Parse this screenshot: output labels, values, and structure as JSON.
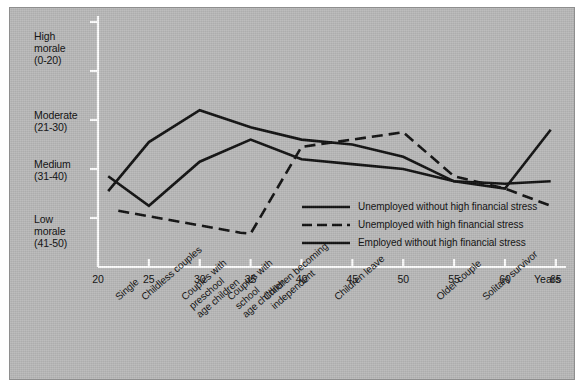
{
  "chart_data": {
    "type": "line",
    "title": "",
    "xlabel": "Years",
    "ylabel": "",
    "xlim": [
      20,
      66
    ],
    "ylim": [
      0,
      50
    ],
    "grid": false,
    "legend_position": "inside-bottom-right",
    "y_axis_bands": [
      {
        "label": "High\nmorale\n(0-20)",
        "range": "0-20"
      },
      {
        "label": "Moderate\n(21-30)",
        "range": "21-30"
      },
      {
        "label": "Medium\n(31-40)",
        "range": "31-40"
      },
      {
        "label": "Low\nmorale\n(41-50)",
        "range": "41-50"
      }
    ],
    "x_tick_labels": [
      "20",
      "25",
      "30",
      "35",
      "40",
      "45",
      "50",
      "55",
      "60",
      "65"
    ],
    "x_tick_values": [
      20,
      25,
      30,
      35,
      40,
      45,
      50,
      55,
      60,
      65
    ],
    "x_axis_unit_label": "Years",
    "life_stage_labels": [
      {
        "text": "Single",
        "at": 21.5
      },
      {
        "text": "Childless couples",
        "at": 24.0
      },
      {
        "text": "Couples with\npreschool\nage children",
        "at": 28.0
      },
      {
        "text": "Couples with\nschool\nage children",
        "at": 32.5
      },
      {
        "text": "Children becoming\nindependent",
        "at": 36.0
      },
      {
        "text": "Children leave",
        "at": 43.0
      },
      {
        "text": "Older couple",
        "at": 53.0
      },
      {
        "text": "Solitary survivor",
        "at": 57.5
      }
    ],
    "series": [
      {
        "name": "Unemployed without high financial stress",
        "style": "solid",
        "color": "#111111",
        "points": [
          {
            "x": 21,
            "y": 34.5
          },
          {
            "x": 25,
            "y": 24.5
          },
          {
            "x": 30,
            "y": 18.0
          },
          {
            "x": 35,
            "y": 21.5
          },
          {
            "x": 40,
            "y": 24.0
          },
          {
            "x": 45,
            "y": 25.0
          },
          {
            "x": 50,
            "y": 27.5
          },
          {
            "x": 55,
            "y": 32.5
          },
          {
            "x": 60,
            "y": 34.0
          },
          {
            "x": 64.5,
            "y": 22.0
          }
        ]
      },
      {
        "name": "Unemployed with high financial stress",
        "style": "dashed",
        "color": "#111111",
        "points": [
          {
            "x": 22,
            "y": 38.5
          },
          {
            "x": 30,
            "y": 41.5
          },
          {
            "x": 34,
            "y": 43.0
          },
          {
            "x": 35,
            "y": 43.2
          },
          {
            "x": 40,
            "y": 25.5
          },
          {
            "x": 45,
            "y": 24.0
          },
          {
            "x": 50,
            "y": 22.5
          },
          {
            "x": 55,
            "y": 31.5
          },
          {
            "x": 60,
            "y": 34.0
          },
          {
            "x": 64.5,
            "y": 37.5
          }
        ]
      },
      {
        "name": "Employed without high financial stress",
        "style": "solid",
        "color": "#111111",
        "points": [
          {
            "x": 21,
            "y": 31.5
          },
          {
            "x": 25,
            "y": 37.5
          },
          {
            "x": 30,
            "y": 28.5
          },
          {
            "x": 35,
            "y": 24.0
          },
          {
            "x": 40,
            "y": 28.0
          },
          {
            "x": 45,
            "y": 29.0
          },
          {
            "x": 50,
            "y": 30.0
          },
          {
            "x": 55,
            "y": 32.5
          },
          {
            "x": 60,
            "y": 33.0
          },
          {
            "x": 64.5,
            "y": 32.5
          }
        ]
      }
    ],
    "legend": [
      {
        "label": "Unemployed without high financial stress",
        "style": "solid"
      },
      {
        "label": "Unemployed with high financial stress",
        "style": "dashed"
      },
      {
        "label": "Employed without high financial stress",
        "style": "solid"
      }
    ]
  }
}
